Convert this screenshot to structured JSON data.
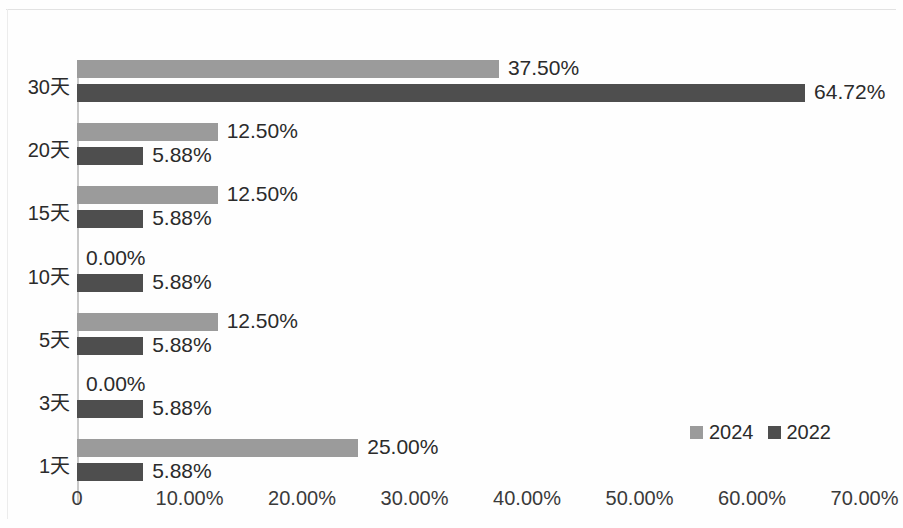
{
  "chart_data": {
    "type": "bar",
    "orientation": "horizontal",
    "title": "",
    "subtitle": "",
    "xlabel": "",
    "ylabel": "",
    "categories": [
      "30天",
      "20天",
      "15天",
      "10天",
      "5天",
      "3天",
      "1天"
    ],
    "series": [
      {
        "name": "2024",
        "color": "#9b9b9b",
        "values": [
          37.5,
          12.5,
          12.5,
          0.0,
          12.5,
          0.0,
          25.0
        ],
        "labels": [
          "37.50%",
          "12.50%",
          "12.50%",
          "0.00%",
          "12.50%",
          "0.00%",
          "25.00%"
        ]
      },
      {
        "name": "2022",
        "color": "#4e4e4e",
        "values": [
          64.72,
          5.88,
          5.88,
          5.88,
          5.88,
          5.88,
          5.88
        ],
        "labels": [
          "64.72%",
          "5.88%",
          "5.88%",
          "5.88%",
          "5.88%",
          "5.88%",
          "5.88%"
        ]
      }
    ],
    "xlim": [
      0,
      70
    ],
    "x_ticks": [
      0,
      10,
      20,
      30,
      40,
      50,
      60,
      70
    ],
    "x_tick_labels": [
      "0",
      "10.00%",
      "20.00%",
      "30.00%",
      "40.00%",
      "50.00%",
      "60.00%",
      "70.00%"
    ],
    "grid": false,
    "legend_position": "bottom-right",
    "legend": [
      "2024",
      "2022"
    ]
  },
  "axis": {
    "value_unit": "%"
  }
}
